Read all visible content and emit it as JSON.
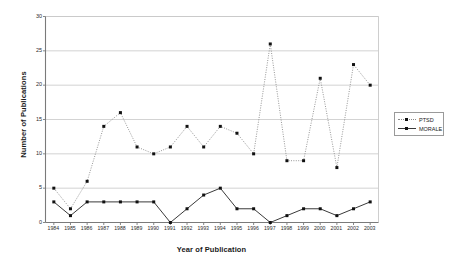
{
  "chart_data": {
    "type": "line",
    "title": "",
    "xlabel": "Year of Publication",
    "ylabel": "Number of Publications",
    "categories": [
      "1984",
      "1985",
      "1986",
      "1987",
      "1988",
      "1989",
      "1990",
      "1991",
      "1992",
      "1993",
      "1994",
      "1995",
      "1996",
      "1997",
      "1998",
      "1999",
      "2000",
      "2001",
      "2002",
      "2003"
    ],
    "x": [
      1984,
      1985,
      1986,
      1987,
      1988,
      1989,
      1990,
      1991,
      1992,
      1993,
      1994,
      1995,
      1996,
      1997,
      1998,
      1999,
      2000,
      2001,
      2002,
      2003
    ],
    "series": [
      {
        "name": "PTSD",
        "style": "dotted",
        "color": "#8a8a8a",
        "marker": "square",
        "values": [
          5,
          2,
          6,
          14,
          16,
          11,
          10,
          11,
          14,
          11,
          14,
          13,
          10,
          26,
          9,
          9,
          21,
          8,
          23,
          20
        ]
      },
      {
        "name": "MORALE",
        "style": "solid",
        "color": "#3a3a3a",
        "marker": "square",
        "values": [
          3,
          1,
          3,
          3,
          3,
          3,
          3,
          0,
          2,
          4,
          5,
          2,
          2,
          0,
          1,
          2,
          2,
          1,
          2,
          3
        ]
      }
    ],
    "ylim": [
      0,
      30
    ],
    "yticks": [
      0,
      5,
      10,
      15,
      20,
      25,
      30
    ],
    "ytick_labels": [
      "0",
      "5",
      "10",
      "15",
      "20",
      "25",
      "30"
    ],
    "grid": "horizontal",
    "grid_color": "#c8c8c8",
    "legend_position": "right",
    "axis_color": "#7a7a7a",
    "background": "#ffffff"
  },
  "legend": {
    "entries": [
      {
        "label": "PTSD"
      },
      {
        "label": "MORALE"
      }
    ]
  }
}
